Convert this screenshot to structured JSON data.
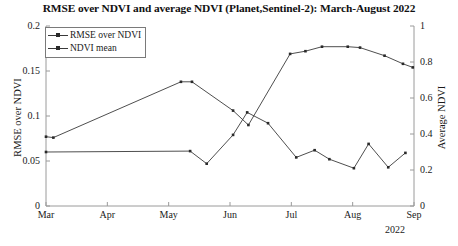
{
  "chart_data": {
    "type": "line",
    "title": "RMSE over NDVI and average NDVI (Planet,Sentinel-2): March-August 2022",
    "xlabel": "",
    "ylabel": "RMSE over NDVI",
    "y2label": "Average NDVI",
    "year_note": "2022",
    "grid": false,
    "legend_position": "upper-left",
    "x_tick_labels": [
      "Mar",
      "Apr",
      "May",
      "Jun",
      "Jul",
      "Aug",
      "Sep"
    ],
    "x_tick_values": [
      0,
      1,
      2,
      3,
      4,
      5,
      6
    ],
    "xlim": [
      0,
      6
    ],
    "y_tick_labels": [
      "0",
      "0.05",
      "0.1",
      "0.15",
      "0.2"
    ],
    "y_tick_values": [
      0,
      0.05,
      0.1,
      0.15,
      0.2
    ],
    "ylim": [
      0,
      0.2
    ],
    "y2_tick_labels": [
      "0",
      "0.2",
      "0.4",
      "0.6",
      "0.8",
      "1"
    ],
    "y2_tick_values": [
      0,
      0.2,
      0.4,
      0.6,
      0.8,
      1
    ],
    "y2lim": [
      0,
      1
    ],
    "series": [
      {
        "name": "RMSE over NDVI",
        "axis": "left",
        "color": "#3a3a3a",
        "marker": "dot",
        "points": [
          {
            "x": 0.0,
            "y": 0.06
          },
          {
            "x": 2.35,
            "y": 0.061
          },
          {
            "x": 2.62,
            "y": 0.047
          },
          {
            "x": 3.05,
            "y": 0.079
          },
          {
            "x": 3.28,
            "y": 0.104
          },
          {
            "x": 3.62,
            "y": 0.092
          },
          {
            "x": 4.08,
            "y": 0.054
          },
          {
            "x": 4.38,
            "y": 0.062
          },
          {
            "x": 4.62,
            "y": 0.052
          },
          {
            "x": 5.02,
            "y": 0.042
          },
          {
            "x": 5.26,
            "y": 0.069
          },
          {
            "x": 5.58,
            "y": 0.043
          },
          {
            "x": 5.86,
            "y": 0.059
          }
        ]
      },
      {
        "name": "NDVI mean",
        "axis": "right",
        "color": "#3a3a3a",
        "marker": "dot",
        "points": [
          {
            "x": 0.0,
            "y": 0.385
          },
          {
            "x": 0.12,
            "y": 0.38
          },
          {
            "x": 2.2,
            "y": 0.69
          },
          {
            "x": 2.38,
            "y": 0.69
          },
          {
            "x": 3.05,
            "y": 0.53
          },
          {
            "x": 3.3,
            "y": 0.45
          },
          {
            "x": 3.98,
            "y": 0.845
          },
          {
            "x": 4.23,
            "y": 0.86
          },
          {
            "x": 4.5,
            "y": 0.885
          },
          {
            "x": 4.92,
            "y": 0.885
          },
          {
            "x": 5.12,
            "y": 0.88
          },
          {
            "x": 5.52,
            "y": 0.835
          },
          {
            "x": 5.82,
            "y": 0.79
          },
          {
            "x": 5.98,
            "y": 0.77
          }
        ]
      }
    ]
  },
  "legend": {
    "items": [
      {
        "label": "RMSE over NDVI"
      },
      {
        "label": "NDVI mean"
      }
    ]
  }
}
